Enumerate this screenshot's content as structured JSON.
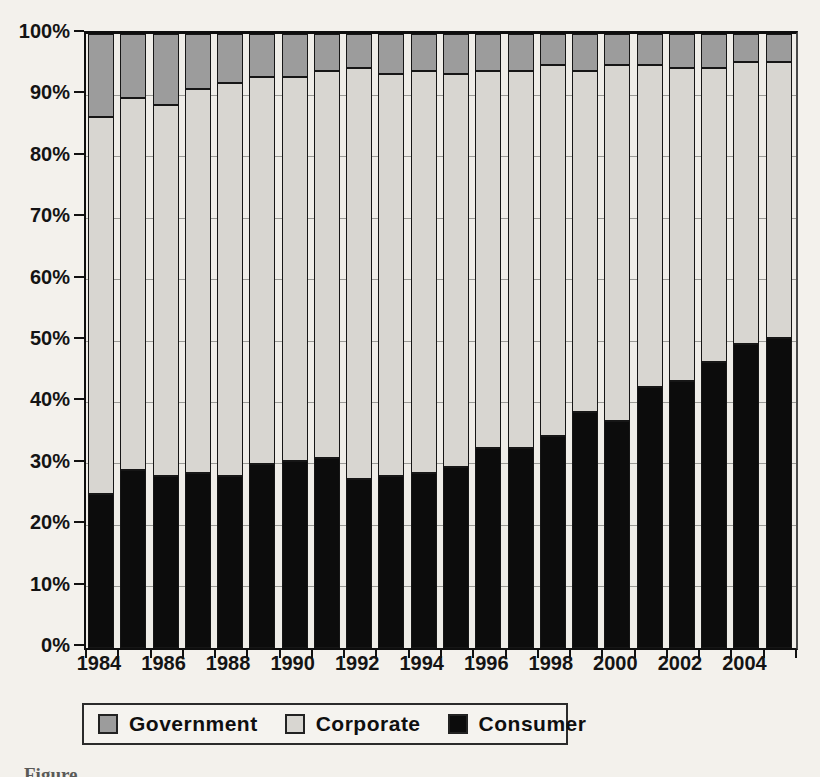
{
  "figure": {
    "background_color": "#f3f1ec",
    "caption_clipped": "Figure"
  },
  "chart_data": {
    "type": "bar",
    "stacked": true,
    "title": "",
    "xlabel": "",
    "ylabel": "",
    "categories": [
      1984,
      1985,
      1986,
      1987,
      1988,
      1989,
      1990,
      1991,
      1992,
      1993,
      1994,
      1995,
      1996,
      1997,
      1998,
      1999,
      2000,
      2001,
      2002,
      2003,
      2004,
      2005
    ],
    "x_axis_tick_labels": [
      "1984",
      "1986",
      "1988",
      "1990",
      "1992",
      "1994",
      "1996",
      "1998",
      "2000",
      "2002",
      "2004"
    ],
    "y_axis_tick_labels": [
      "0%",
      "10%",
      "20%",
      "30%",
      "40%",
      "50%",
      "60%",
      "70%",
      "80%",
      "90%",
      "100%"
    ],
    "ylim": [
      0,
      100
    ],
    "y_unit": "%",
    "grid": true,
    "legend_position": "bottom",
    "series": [
      {
        "name": "Consumer",
        "color": "#0c0c0c",
        "stack_position": "bottom",
        "values": [
          25,
          29,
          28,
          28.5,
          28,
          30,
          30.5,
          31,
          27.5,
          28,
          28.5,
          29.5,
          32.5,
          32.5,
          34.5,
          38.5,
          37,
          42.5,
          43.5,
          46.5,
          49.5,
          50.5
        ]
      },
      {
        "name": "Corporate",
        "color": "#d8d6d1",
        "stack_position": "middle",
        "values": [
          61.5,
          60.5,
          60.5,
          62.5,
          64,
          63,
          62.5,
          63,
          67,
          65.5,
          65.5,
          64,
          61.5,
          61.5,
          60.5,
          55.5,
          58,
          52.5,
          51,
          48,
          46,
          45
        ]
      },
      {
        "name": "Government",
        "color": "#9c9c9c",
        "stack_position": "top",
        "values": [
          13.5,
          10.5,
          11.5,
          9,
          8,
          7,
          7,
          6,
          5.5,
          6.5,
          6,
          6.5,
          6,
          6,
          5,
          6,
          5,
          5,
          5.5,
          5.5,
          4.5,
          4.5
        ]
      }
    ],
    "legend_items": [
      {
        "label": "Government",
        "color": "#9c9c9c"
      },
      {
        "label": "Corporate",
        "color": "#d8d6d1"
      },
      {
        "label": "Consumer",
        "color": "#0c0c0c"
      }
    ]
  }
}
